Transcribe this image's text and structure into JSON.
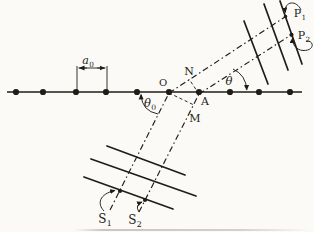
{
  "figure": {
    "title_hint": "row-of-atoms diffraction construction",
    "paper_color": "#fbfaf7",
    "ink_color": "#201d18",
    "lattice": {
      "y": 92,
      "x1": 7,
      "x2": 302,
      "atom_r": 3.1,
      "atom_xs": [
        16,
        43,
        76,
        106,
        137,
        169,
        199,
        230,
        259,
        290
      ]
    },
    "rays": [
      {
        "name": "incident-ray-s1",
        "x1": 110,
        "y1": 210,
        "x2": 169,
        "y2": 93
      },
      {
        "name": "incident-ray-s2",
        "x1": 139,
        "y1": 212,
        "x2": 199,
        "y2": 94
      },
      {
        "name": "diffracted-ray-p1",
        "x1": 169,
        "y1": 93,
        "x2": 288,
        "y2": 15
      },
      {
        "name": "diffracted-ray-p2",
        "x1": 199,
        "y1": 94,
        "x2": 291,
        "y2": 35
      }
    ],
    "wavefronts": [
      {
        "name": "incident-wavefront-1",
        "x1": 107,
        "y1": 146,
        "x2": 185,
        "y2": 175
      },
      {
        "name": "incident-wavefront-2",
        "x1": 91,
        "y1": 159,
        "x2": 196,
        "y2": 196
      },
      {
        "name": "incident-wavefront-3",
        "x1": 84,
        "y1": 177,
        "x2": 173,
        "y2": 209
      },
      {
        "name": "diffracted-wavefront-1",
        "x1": 244,
        "y1": 21,
        "x2": 268,
        "y2": 84
      },
      {
        "name": "diffracted-wavefront-2",
        "x1": 264,
        "y1": 4,
        "x2": 288,
        "y2": 70
      },
      {
        "name": "diffracted-wavefront-3",
        "x1": 280,
        "y1": 1,
        "x2": 302,
        "y2": 64
      }
    ],
    "construction": [
      {
        "name": "perpendicular-an",
        "x1": 199,
        "y1": 94,
        "x2": 189,
        "y2": 79
      },
      {
        "name": "perpendicular-om",
        "x1": 169,
        "y1": 93,
        "x2": 194,
        "y2": 105
      }
    ],
    "points": [
      {
        "name": "s1-wavefront-point",
        "x": 120,
        "y": 191,
        "r": 2.1
      },
      {
        "name": "s2-wavefront-point",
        "x": 145,
        "y": 200,
        "r": 2.1
      },
      {
        "name": "p1-wavefront-point",
        "x": 285.5,
        "y": 16.5,
        "r": 1.7
      },
      {
        "name": "p2-wavefront-point",
        "x": 291.5,
        "y": 34.8,
        "r": 2.1
      }
    ],
    "angle_arcs": [
      {
        "name": "theta0-angle-arc",
        "path": "M 141,95 Q 142,111 158,114",
        "arrow": "start"
      },
      {
        "name": "theta-angle-arc",
        "path": "M 233,69 Q 246,75 246.8,90",
        "arrow": "end"
      }
    ],
    "pointer_arrows": [
      {
        "name": "s1-pointer-arrow",
        "path": "M 104,211 C 97,204 99,194 115,190.5"
      },
      {
        "name": "s2-pointer-arrow",
        "path": "M 139,212 Q 134.5,205 142,202"
      },
      {
        "name": "p1-pointer-arrow",
        "path": "M 301,10 C 297,0 284,0.5 285.3,12.5"
      },
      {
        "name": "p2-pointer-arrow",
        "path": "M 306,41 C 314.5,40 315,51 303,50.5 C 296,50 292,44 292.6,38.2"
      }
    ],
    "dimension": {
      "tick_left": {
        "x": 77,
        "y1": 66,
        "y2": 90
      },
      "tick_right": {
        "x": 107,
        "y1": 66,
        "y2": 90
      },
      "line": {
        "x1": 78.5,
        "x2": 105.5,
        "y": 68
      },
      "arrow_left": {
        "x1": 87,
        "x2": 79.5,
        "y": 68
      },
      "arrow_right": {
        "x1": 97,
        "x2": 104.5,
        "y": 68
      }
    },
    "labels": [
      {
        "name": "label-o",
        "text": "O",
        "sub": "",
        "x": 163,
        "y": 86,
        "size": 10,
        "italic": false
      },
      {
        "name": "label-a",
        "text": "A",
        "sub": "",
        "x": 205,
        "y": 105,
        "size": 11,
        "italic": false
      },
      {
        "name": "label-n",
        "text": "N",
        "sub": "",
        "x": 189,
        "y": 75,
        "size": 11,
        "italic": false
      },
      {
        "name": "label-m",
        "text": "M",
        "sub": "",
        "x": 195,
        "y": 122,
        "size": 11,
        "italic": false
      },
      {
        "name": "label-theta",
        "text": "θ",
        "sub": "",
        "x": 229,
        "y": 85,
        "size": 11.5,
        "italic": true
      },
      {
        "name": "label-theta0",
        "text": "θ",
        "sub": "0",
        "x": 150,
        "y": 107,
        "size": 11.5,
        "italic": true
      },
      {
        "name": "label-a0",
        "text": "a",
        "sub": "0",
        "x": 88,
        "y": 64,
        "size": 11,
        "italic": true
      },
      {
        "name": "label-s1",
        "text": "S",
        "sub": "1",
        "x": 105,
        "y": 223,
        "size": 12,
        "italic": false
      },
      {
        "name": "label-s2",
        "text": "S",
        "sub": "2",
        "x": 135,
        "y": 224,
        "size": 12,
        "italic": false
      },
      {
        "name": "label-p1",
        "text": "P",
        "sub": "1",
        "x": 300,
        "y": 17,
        "size": 11,
        "italic": false
      },
      {
        "name": "label-p2",
        "text": "P",
        "sub": "2",
        "x": 304,
        "y": 39,
        "size": 11,
        "italic": false
      }
    ]
  }
}
